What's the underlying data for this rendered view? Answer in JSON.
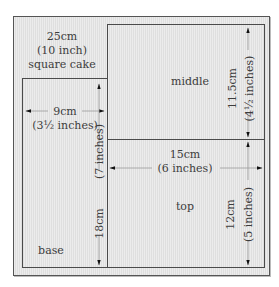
{
  "diagram": {
    "outer_label": {
      "line1": "25cm",
      "line2": "(10 inch)",
      "line3": "square cake"
    },
    "pieces": {
      "middle": {
        "label": "middle",
        "height_cm": "11.5cm",
        "height_in": "(4½ inches)"
      },
      "top": {
        "label": "top",
        "width_cm": "15cm",
        "width_in": "(6 inches)",
        "height_cm": "12cm",
        "height_in": "(5 inches)"
      },
      "base": {
        "label": "base",
        "width_cm": "9cm",
        "width_in": "(3½ inches)",
        "height_cm": "18cm",
        "height_in": "(7 inches)"
      }
    },
    "colors": {
      "fill": "#e6e6e6",
      "line": "#4a4a4a"
    }
  }
}
